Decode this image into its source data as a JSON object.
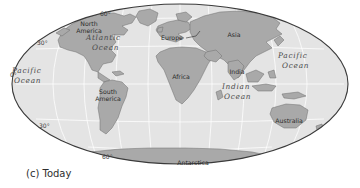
{
  "figure": {
    "caption": "(c) Today",
    "projection": "mollweide-ellipse",
    "colors": {
      "ocean": "#e4e4e4",
      "land": "#a9a9a9",
      "land_stroke": "#6e6e6e",
      "graticule": "#ffffff",
      "outline": "#3a3a3a",
      "background": "#ffffff",
      "label_dark": "#2b2b2b",
      "label_ocean": "#4a4a4a"
    }
  },
  "ocean_labels": [
    {
      "name": "pacific-ocean-west",
      "line1": "Pacific",
      "line2": "Ocean",
      "x": 22,
      "y": 76
    },
    {
      "name": "atlantic-ocean",
      "line1": "Atlantic",
      "line2": "Ocean",
      "x": 103,
      "y": 42
    },
    {
      "name": "indian-ocean",
      "line1": "Indian",
      "line2": "Ocean",
      "x": 228,
      "y": 92
    },
    {
      "name": "pacific-ocean-east",
      "line1": "Pacific",
      "line2": "Ocean",
      "x": 287,
      "y": 62
    }
  ],
  "continent_labels": [
    {
      "name": "north-america",
      "line1": "North",
      "line2": "America",
      "x": 89,
      "y": 28
    },
    {
      "name": "south-america",
      "line1": "South",
      "line2": "America",
      "x": 106,
      "y": 96
    },
    {
      "name": "europe",
      "line1": "Europe",
      "line2": "",
      "x": 172,
      "y": 38,
      "leader": true
    },
    {
      "name": "asia",
      "line1": "Asia",
      "line2": "",
      "x": 234,
      "y": 36
    },
    {
      "name": "africa",
      "line1": "Africa",
      "line2": "",
      "x": 181,
      "y": 77
    },
    {
      "name": "india",
      "line1": "India",
      "line2": "",
      "x": 236,
      "y": 73
    },
    {
      "name": "australia",
      "line1": "Australia",
      "line2": "",
      "x": 288,
      "y": 121
    },
    {
      "name": "antarctica",
      "line1": "Antarctica",
      "line2": "",
      "x": 192,
      "y": 164
    }
  ],
  "latitude_labels": [
    {
      "name": "lat-60-north",
      "text": "60°",
      "x": 106,
      "y": 14
    },
    {
      "name": "lat-30-north",
      "text": "30°",
      "x": 43,
      "y": 43
    },
    {
      "name": "lat-0-equator",
      "text": "0°",
      "x": 16,
      "y": 75
    },
    {
      "name": "lat-30-south",
      "text": "30°",
      "x": 45,
      "y": 126
    },
    {
      "name": "lat-60-south",
      "text": "60°",
      "x": 108,
      "y": 157
    }
  ]
}
